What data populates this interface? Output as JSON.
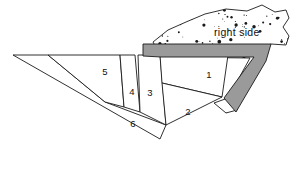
{
  "figure": {
    "background_color": "#ffffff",
    "line_color": "#1a1a1a",
    "band_color": "#9a9a9a",
    "rock_fill_color": "#ffffff",
    "stipple_color": "#1a1a1a"
  },
  "annotations": [
    {
      "name": "right-side",
      "text": "right side",
      "x": 214,
      "y": 33
    }
  ],
  "regions": [
    {
      "id": "1",
      "label": "1",
      "label_x": 209,
      "label_y": 75
    },
    {
      "id": "2",
      "label": "2",
      "label_x": 188,
      "label_y": 112
    },
    {
      "id": "3",
      "label": "3",
      "label_x": 150,
      "label_y": 93
    },
    {
      "id": "4",
      "label": "4",
      "label_x": 132,
      "label_y": 92
    },
    {
      "id": "5",
      "label": "5",
      "label_x": 105,
      "label_y": 72
    },
    {
      "id": "6",
      "label": "6",
      "label_x": 133,
      "label_y": 124
    }
  ],
  "geometry": {
    "region_5": "48,55 120,55 124,107 105,102",
    "region_4": "120,55 135,55 140,112 124,107",
    "region_3": "138,55 160,55 166,125 140,112",
    "region_1": "160,55 228,55 222,97 162,83",
    "region_2": "162,83 222,97 166,125",
    "region_6": "13,55 48,55 105,102 166,125 160,139",
    "band": "143,44 271,44 266,61 236,112 224,98 254,57 161,57 143,56",
    "rock": "153,42 168,30 186,22 205,14 226,9 247,11 262,5 275,12 286,10 289,18 283,27 289,36 286,45 271,44 255,56 237,110 226,113 214,103 228,98 250,58 161,57"
  },
  "stipple": {
    "seed_note": "procedural dots inside rock outline",
    "dot_count": 260
  }
}
